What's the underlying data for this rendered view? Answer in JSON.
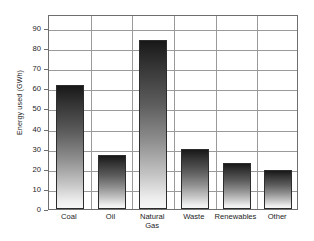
{
  "chart_data": {
    "type": "bar",
    "title": "",
    "subtitle": "",
    "xlabel": "",
    "ylabel": "Energy used (GWh)",
    "categories": [
      "Coal",
      "Oil",
      "Natural Gas",
      "Waste",
      "Renewables",
      "Other"
    ],
    "values": [
      61.5,
      27,
      84,
      30,
      23,
      19.5
    ],
    "ylim": [
      0,
      97
    ],
    "yticks": [
      0,
      10,
      20,
      30,
      40,
      50,
      60,
      70,
      80,
      90
    ],
    "ytick_labels": [
      "0",
      "10",
      "20",
      "30",
      "40",
      "50",
      "60",
      "70",
      "80",
      "90"
    ],
    "grid": true,
    "grid_axis": "y",
    "legend": false,
    "legend_position": "none",
    "bar_style": "vertical-gradient-dark-to-light",
    "colors": {
      "bar_top": "#181818",
      "bar_bottom": "#f7f7f7",
      "bar_outline": "#2d2d2d",
      "gridline": "#9a9a9a",
      "frame": "#6e6e6e",
      "text": "#1c1c1c",
      "background": "#ffffff"
    }
  },
  "category_labels": [
    {
      "line1": "Coal",
      "line2": ""
    },
    {
      "line1": "Oil",
      "line2": ""
    },
    {
      "line1": "Natural",
      "line2": "Gas"
    },
    {
      "line1": "Waste",
      "line2": ""
    },
    {
      "line1": "Renewables",
      "line2": ""
    },
    {
      "line1": "Other",
      "line2": ""
    }
  ]
}
